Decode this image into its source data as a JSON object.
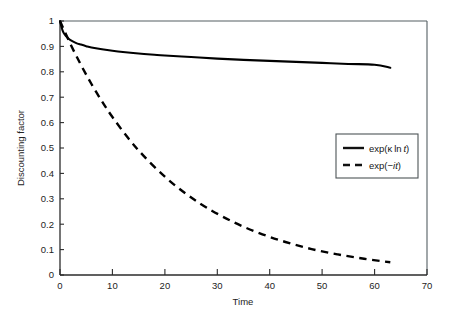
{
  "chart_data": {
    "type": "line",
    "title": "",
    "subtitle": "",
    "xlabel": "Time",
    "ylabel": "Discounting factor",
    "xlim": [
      0,
      70
    ],
    "ylim": [
      0,
      1
    ],
    "xticks": [
      0,
      10,
      20,
      30,
      40,
      50,
      60,
      70
    ],
    "xtick_labels": [
      "0",
      "10",
      "20",
      "30",
      "40",
      "50",
      "60",
      "70"
    ],
    "yticks": [
      0,
      0.1,
      0.2,
      0.3,
      0.4,
      0.5,
      0.6,
      0.7,
      0.8,
      0.9,
      1
    ],
    "ytick_labels": [
      "0",
      "0.1",
      "0.2",
      "0.3",
      "0.4",
      "0.5",
      "0.6",
      "0.7",
      "0.8",
      "0.9",
      "1"
    ],
    "grid": false,
    "legend_position": "center-right",
    "series": [
      {
        "name": "exp(κ ln t)",
        "style": "solid",
        "color": "#000000",
        "x": [
          0,
          0.5,
          1,
          1.5,
          2,
          3,
          4,
          5,
          6,
          8,
          10,
          12,
          15,
          18,
          20,
          25,
          30,
          35,
          40,
          45,
          50,
          55,
          60,
          63
        ],
        "values": [
          1.0,
          0.962,
          0.944,
          0.933,
          0.925,
          0.914,
          0.907,
          0.901,
          0.896,
          0.889,
          0.883,
          0.878,
          0.872,
          0.867,
          0.864,
          0.858,
          0.852,
          0.847,
          0.843,
          0.839,
          0.835,
          0.831,
          0.828,
          0.816
        ]
      },
      {
        "name": "exp(−it)",
        "style": "dashed",
        "color": "#000000",
        "x": [
          0,
          2,
          4,
          6,
          8,
          10,
          13,
          16,
          20,
          24,
          28,
          33,
          38,
          43,
          48,
          53,
          58,
          63
        ],
        "values": [
          1.0,
          0.909,
          0.827,
          0.752,
          0.684,
          0.622,
          0.539,
          0.468,
          0.387,
          0.32,
          0.265,
          0.209,
          0.165,
          0.13,
          0.102,
          0.081,
          0.064,
          0.05
        ]
      }
    ],
    "legend_entries": [
      {
        "label_prefix": "exp(",
        "label_kappa": "κ",
        "label_mid": "ln ",
        "label_var": "t",
        "label_suffix": ")",
        "style": "solid"
      },
      {
        "label_prefix": "exp(",
        "label_minus": "−",
        "label_i": "i",
        "label_var": "t",
        "label_suffix": ")",
        "style": "dashed"
      }
    ]
  },
  "legend": {
    "entry_solid_full": "exp(κ ln t)",
    "entry_dashed_full": "exp(−it)"
  },
  "axes": {
    "x_title": "Time",
    "y_title": "Discounting factor"
  }
}
